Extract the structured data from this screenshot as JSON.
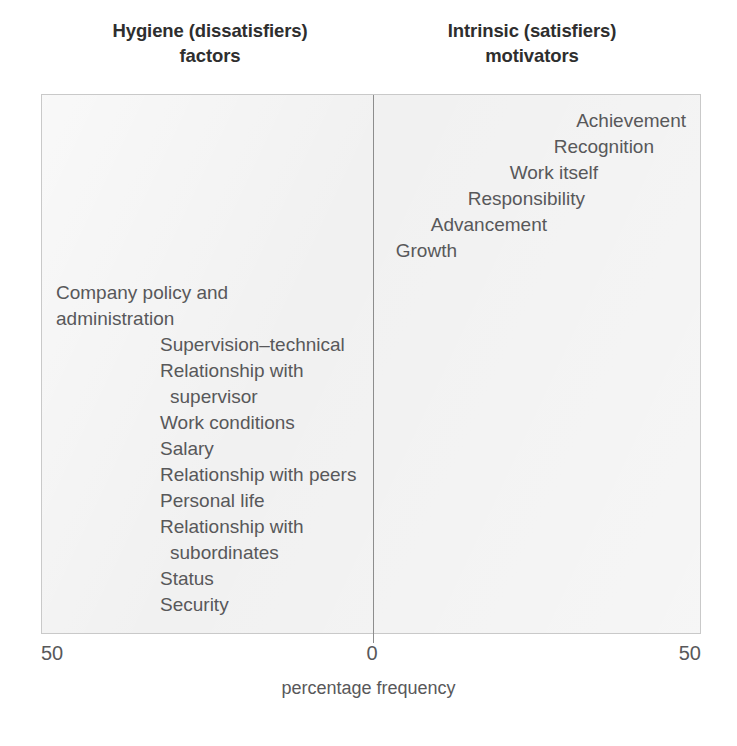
{
  "headers": {
    "left": "Hygiene (dissatisfiers)\nfactors",
    "right": "Intrinsic (satisfiers)\nmotivators"
  },
  "chart_data": {
    "type": "table",
    "xlabel": "percentage frequency",
    "ylabel": "",
    "xlim": [
      -50,
      50
    ],
    "grid": false,
    "legend": "none",
    "axis_ticks": [
      "50",
      "0",
      "50"
    ],
    "center_value": "0",
    "series": [
      {
        "name": "Hygiene (dissatisfiers) factors",
        "side": "left",
        "items": [
          "Company policy and",
          "administration",
          "Supervision–technical",
          "Relationship with",
          "supervisor",
          "Work conditions",
          "Salary",
          "Relationship with peers",
          "Personal life",
          "Relationship with",
          "subordinates",
          "Status",
          "Security"
        ]
      },
      {
        "name": "Intrinsic (satisfiers) motivators",
        "side": "right",
        "items": [
          "Achievement",
          "Recognition",
          "Work itself",
          "Responsibility",
          "Advancement",
          "Growth"
        ]
      }
    ]
  },
  "hygiene_lines": [
    {
      "text": "Company policy and",
      "indent": 0
    },
    {
      "text": "administration",
      "indent": 0
    },
    {
      "text": "Supervision–technical",
      "indent": 1
    },
    {
      "text": "Relationship with",
      "indent": 1
    },
    {
      "text": "supervisor",
      "indent": 2
    },
    {
      "text": "Work conditions",
      "indent": 1
    },
    {
      "text": "Salary",
      "indent": 1
    },
    {
      "text": "Relationship with peers",
      "indent": 1
    },
    {
      "text": "Personal life",
      "indent": 1
    },
    {
      "text": "Relationship with",
      "indent": 1
    },
    {
      "text": "subordinates",
      "indent": 2
    },
    {
      "text": "Status",
      "indent": 1
    },
    {
      "text": "Security",
      "indent": 1
    }
  ],
  "motivator_lines": [
    {
      "text": "Achievement",
      "offset": 0
    },
    {
      "text": "Recognition",
      "offset": 32
    },
    {
      "text": "Work itself",
      "offset": 88
    },
    {
      "text": "Responsibility",
      "offset": 101
    },
    {
      "text": "Advancement",
      "offset": 139
    },
    {
      "text": "Growth",
      "offset": 229
    }
  ],
  "axis": {
    "left_tick": "50",
    "center_tick": "0",
    "right_tick": "50",
    "title": "percentage frequency"
  },
  "colors": {
    "page_background": "#ffffff",
    "plot_background": "#f1f1f1",
    "plot_border": "#c9c9c9",
    "divider": "#8d8d8d",
    "header_text": "#2e2e2e",
    "body_text": "#58585a"
  }
}
